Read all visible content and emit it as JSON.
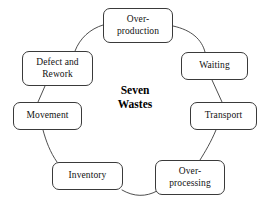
{
  "diagram": {
    "title": "Seven Wastes",
    "center_label": "Seven\nWastes",
    "type": "cycle",
    "background_color": "#ffffff",
    "line_color": "#3a3a3a",
    "text_color": "#111111",
    "nodes": [
      {
        "id": "over-production",
        "label": "Over-\nproduction",
        "position": "top"
      },
      {
        "id": "waiting",
        "label": "Waiting",
        "position": "upper-right"
      },
      {
        "id": "transport",
        "label": "Transport",
        "position": "lower-right"
      },
      {
        "id": "over-processing",
        "label": "Over-\nprocessing",
        "position": "bottom-right"
      },
      {
        "id": "inventory",
        "label": "Inventory",
        "position": "bottom-left"
      },
      {
        "id": "movement",
        "label": "Movement",
        "position": "lower-left"
      },
      {
        "id": "defect-and-rework",
        "label": "Defect and\nRework",
        "position": "upper-left"
      }
    ],
    "connectors": [
      {
        "from": "over-production",
        "to": "waiting"
      },
      {
        "from": "waiting",
        "to": "transport"
      },
      {
        "from": "transport",
        "to": "over-processing"
      },
      {
        "from": "over-processing",
        "to": "inventory"
      },
      {
        "from": "inventory",
        "to": "movement"
      },
      {
        "from": "movement",
        "to": "defect-and-rework"
      },
      {
        "from": "defect-and-rework",
        "to": "over-production"
      }
    ]
  }
}
